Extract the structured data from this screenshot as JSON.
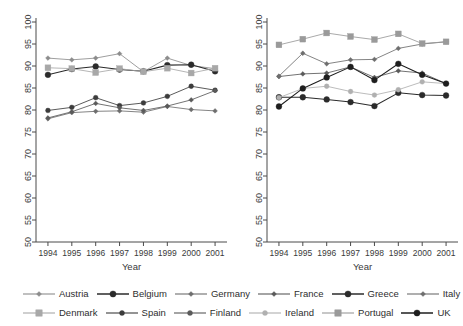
{
  "chart_data": {
    "type": "line",
    "title": "",
    "panels": [
      {
        "name": "left-panel",
        "xlabel": "Year",
        "ylabel": "",
        "x": [
          1994,
          1995,
          1996,
          1997,
          1998,
          1999,
          2000,
          2001
        ],
        "xlim": [
          1993.5,
          2001.5
        ],
        "ylim": [
          50,
          100
        ],
        "grid": false,
        "series": [
          {
            "name": "Austria",
            "color": "#8c8c8c",
            "marker": "diamond",
            "values": [
              91.8,
              91.4,
              91.8,
              92.8,
              88.7,
              91.8,
              90.1,
              89.4
            ]
          },
          {
            "name": "Belgium",
            "color": "#2b2b2b",
            "marker": "circle",
            "values": [
              88.0,
              89.3,
              89.9,
              89.2,
              88.8,
              90.2,
              90.3,
              88.8
            ]
          },
          {
            "name": "Germany",
            "color": "#6e6e6e",
            "marker": "diamond",
            "values": [
              78.0,
              79.4,
              79.7,
              79.8,
              79.5,
              80.8,
              80.1,
              79.8
            ]
          },
          {
            "name": "Denmark",
            "color": "#a8a8a8",
            "marker": "square",
            "values": [
              89.6,
              89.4,
              88.5,
              89.4,
              88.7,
              89.5,
              88.4,
              89.5
            ]
          },
          {
            "name": "Spain",
            "color": "#3c3c3c",
            "marker": "circle",
            "values": [
              79.9,
              80.6,
              82.8,
              81.0,
              81.6,
              83.1,
              85.4,
              84.5
            ]
          },
          {
            "name": "Finland",
            "color": "#5a5a5a",
            "marker": "diamond",
            "values": [
              78.2,
              79.6,
              81.5,
              80.5,
              79.9,
              80.9,
              82.3,
              84.4
            ]
          }
        ]
      },
      {
        "name": "right-panel",
        "xlabel": "Year",
        "ylabel": "",
        "x": [
          1994,
          1995,
          1996,
          1997,
          1998,
          1999,
          2000,
          2001
        ],
        "xlim": [
          1993.5,
          2001.5
        ],
        "ylim": [
          50,
          100
        ],
        "grid": false,
        "series": [
          {
            "name": "France",
            "color": "#5a5a5a",
            "marker": "diamond",
            "values": [
              87.6,
              88.2,
              88.4,
              89.8,
              87.4,
              88.9,
              88.4,
              86.0
            ]
          },
          {
            "name": "Greece",
            "color": "#2b2b2b",
            "marker": "circle",
            "values": [
              82.9,
              82.9,
              82.4,
              81.8,
              80.9,
              83.9,
              83.4,
              83.3
            ]
          },
          {
            "name": "Italy",
            "color": "#6e6e6e",
            "marker": "diamond",
            "values": [
              87.7,
              92.9,
              90.5,
              91.4,
              91.5,
              94.0,
              95.0,
              95.5
            ]
          },
          {
            "name": "Ireland",
            "color": "#b0b0b0",
            "marker": "circle",
            "values": [
              82.8,
              84.9,
              85.4,
              84.2,
              83.4,
              84.6,
              86.4,
              86.0
            ]
          },
          {
            "name": "Portugal",
            "color": "#9a9a9a",
            "marker": "square",
            "values": [
              94.8,
              96.1,
              97.5,
              96.7,
              96.0,
              97.3,
              95.1,
              95.5
            ]
          },
          {
            "name": "UK",
            "color": "#1e1e1e",
            "marker": "circle",
            "values": [
              80.8,
              84.9,
              87.4,
              89.8,
              86.8,
              90.5,
              88.0,
              86.0
            ]
          }
        ]
      }
    ],
    "y_ticks": [
      50,
      55,
      60,
      65,
      70,
      75,
      80,
      85,
      90,
      95,
      100
    ],
    "x_ticks": [
      1994,
      1995,
      1996,
      1997,
      1998,
      1999,
      2000,
      2001
    ],
    "legend_position": "bottom"
  },
  "legend": {
    "rows": [
      [
        {
          "label": "Austria",
          "color": "#8c8c8c",
          "marker": "diamond"
        },
        {
          "label": "Belgium",
          "color": "#2b2b2b",
          "marker": "circle"
        },
        {
          "label": "Germany",
          "color": "#6e6e6e",
          "marker": "diamond"
        },
        {
          "label": "France",
          "color": "#5a5a5a",
          "marker": "diamond"
        },
        {
          "label": "Greece",
          "color": "#2b2b2b",
          "marker": "circle"
        },
        {
          "label": "Italy",
          "color": "#6e6e6e",
          "marker": "diamond"
        }
      ],
      [
        {
          "label": "Denmark",
          "color": "#a8a8a8",
          "marker": "square"
        },
        {
          "label": "Spain",
          "color": "#3c3c3c",
          "marker": "circle"
        },
        {
          "label": "Finland",
          "color": "#5a5a5a",
          "marker": "circle"
        },
        {
          "label": "Ireland",
          "color": "#b0b0b0",
          "marker": "circle"
        },
        {
          "label": "Portugal",
          "color": "#9a9a9a",
          "marker": "square"
        },
        {
          "label": "UK",
          "color": "#1e1e1e",
          "marker": "circle"
        }
      ]
    ]
  }
}
